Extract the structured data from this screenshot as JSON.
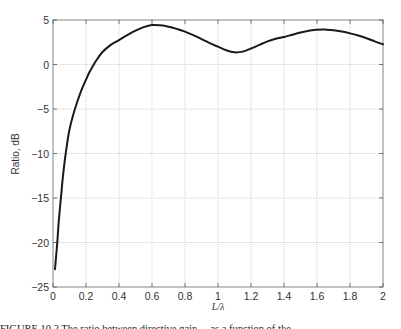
{
  "chart_data": {
    "type": "line",
    "title": "",
    "xlabel": "L/λ",
    "ylabel": "Ratio, dB",
    "xlim": [
      0,
      2
    ],
    "ylim": [
      -25,
      5
    ],
    "xticks": [
      0,
      0.2,
      0.4,
      0.6,
      0.8,
      1,
      1.2,
      1.4,
      1.6,
      1.8,
      2
    ],
    "xtick_labels": [
      "0",
      "0.2",
      "0.4",
      "0.6",
      "0.8",
      "1",
      "1.2",
      "1.4",
      "1.6",
      "1.8",
      "2"
    ],
    "yticks": [
      5,
      0,
      -5,
      -10,
      -15,
      -20,
      -25
    ],
    "ytick_labels": [
      "5",
      "0",
      "−5",
      "−10",
      "−15",
      "−20",
      "−25"
    ],
    "grid": true,
    "legend": null,
    "series": [
      {
        "name": "Ratio",
        "color": "#1a1a1a",
        "x": [
          0.012,
          0.02,
          0.026,
          0.035,
          0.048,
          0.06,
          0.077,
          0.1,
          0.133,
          0.17,
          0.2,
          0.22,
          0.26,
          0.3,
          0.35,
          0.4,
          0.45,
          0.5,
          0.55,
          0.6,
          0.65,
          0.7,
          0.75,
          0.8,
          0.85,
          0.9,
          0.95,
          1.0,
          1.05,
          1.1,
          1.15,
          1.2,
          1.25,
          1.3,
          1.35,
          1.4,
          1.45,
          1.5,
          1.55,
          1.6,
          1.63,
          1.65,
          1.7,
          1.75,
          1.8,
          1.85,
          1.9,
          1.95,
          2.0
        ],
        "y": [
          -23.0,
          -21.3,
          -20.0,
          -17.6,
          -15.0,
          -12.6,
          -10.0,
          -7.3,
          -5.0,
          -3.0,
          -1.7,
          -0.9,
          0.4,
          1.4,
          2.2,
          2.75,
          3.3,
          3.8,
          4.2,
          4.44,
          4.4,
          4.25,
          4.0,
          3.7,
          3.3,
          2.85,
          2.4,
          2.0,
          1.6,
          1.37,
          1.45,
          1.8,
          2.2,
          2.6,
          2.9,
          3.1,
          3.35,
          3.6,
          3.8,
          3.9,
          3.93,
          3.92,
          3.85,
          3.7,
          3.5,
          3.25,
          2.95,
          2.6,
          2.27
        ]
      }
    ]
  },
  "figure": {
    "caption": "FIGURE 10.2   The ratio between directive gain ... as a function of the ..."
  }
}
